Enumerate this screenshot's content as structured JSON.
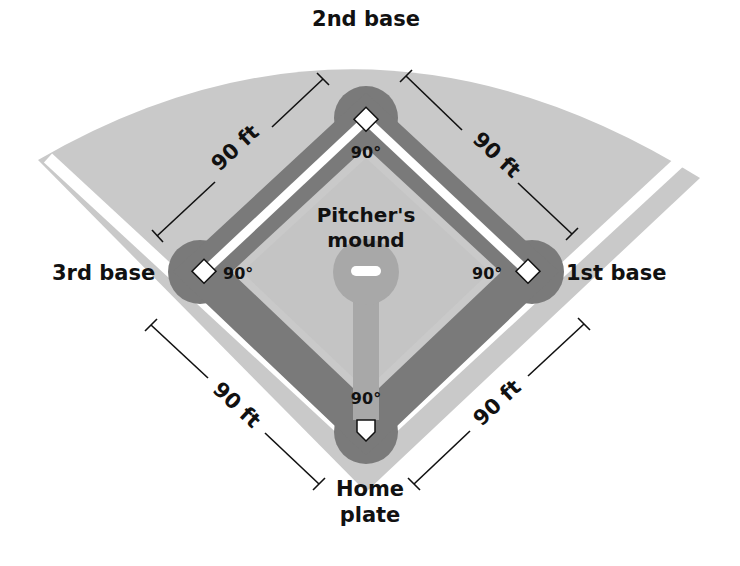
{
  "diagram": {
    "bases": {
      "second": "2nd base",
      "third": "3rd base",
      "first": "1st base",
      "home_line1": "Home",
      "home_line2": "plate"
    },
    "mound": {
      "line1": "Pitcher's",
      "line2": "mound"
    },
    "angles": {
      "second": "90°",
      "third": "90°",
      "first": "90°",
      "home": "90°"
    },
    "distances": {
      "second_to_third": "90 ft",
      "second_to_first": "90 ft",
      "third_to_home": "90 ft",
      "home_to_first": "90 ft"
    },
    "colors": {
      "outfield": "#c8c8c8",
      "basepath": "#7a7a7a",
      "foul_line": "#ffffff",
      "mound_area": "#a8a8a8",
      "text": "#111111"
    }
  }
}
